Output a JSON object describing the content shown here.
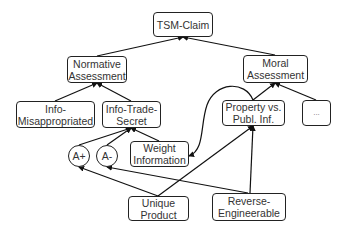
{
  "diagram": {
    "nodes": {
      "tsm_claim": "TSM-Claim",
      "normative_assessment": "Normative Assessment",
      "moral_assessment": "Moral Assessment",
      "info_misappropriated": "Info-Misappropriated",
      "info_trade_secret": "Info-Trade-Secret",
      "property_vs_publ_inf": "Property vs. Publ. Inf.",
      "ellipsis": "...",
      "a_plus": "A+",
      "a_minus": "A-",
      "weight_information": "Weight Information",
      "unique_product": "Unique Product",
      "reverse_engineerable": "Reverse-Engineerable"
    },
    "edges": [
      {
        "from": "normative_assessment",
        "to": "tsm_claim"
      },
      {
        "from": "moral_assessment",
        "to": "tsm_claim"
      },
      {
        "from": "info_misappropriated",
        "to": "normative_assessment"
      },
      {
        "from": "info_trade_secret",
        "to": "normative_assessment"
      },
      {
        "from": "property_vs_publ_inf",
        "to": "moral_assessment"
      },
      {
        "from": "ellipsis",
        "to": "moral_assessment"
      },
      {
        "from": "a_plus",
        "to": "info_trade_secret"
      },
      {
        "from": "a_minus",
        "to": "info_trade_secret"
      },
      {
        "from": "weight_information",
        "to": "info_trade_secret"
      },
      {
        "from": "unique_product",
        "to": "a_plus"
      },
      {
        "from": "unique_product",
        "to": "property_vs_publ_inf"
      },
      {
        "from": "reverse_engineerable",
        "to": "a_minus"
      },
      {
        "from": "reverse_engineerable",
        "to": "property_vs_publ_inf"
      },
      {
        "from": "property_vs_publ_inf",
        "to": "weight_information",
        "curved": true
      }
    ]
  }
}
